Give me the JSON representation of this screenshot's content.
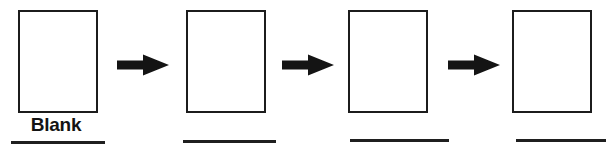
{
  "diagram": {
    "background_color": "#ffffff",
    "stroke_color": "#1c1c1c",
    "text_color": "#131313",
    "box_count": 4,
    "arrow_count": 3,
    "steps": [
      {
        "label": "Blank",
        "box_content": ""
      },
      {
        "label": "",
        "box_content": ""
      },
      {
        "label": "",
        "box_content": ""
      },
      {
        "label": "",
        "box_content": ""
      }
    ],
    "arrows": [
      {
        "name": "arrow-1",
        "direction": "right"
      },
      {
        "name": "arrow-2",
        "direction": "right"
      },
      {
        "name": "arrow-3",
        "direction": "right"
      }
    ]
  }
}
